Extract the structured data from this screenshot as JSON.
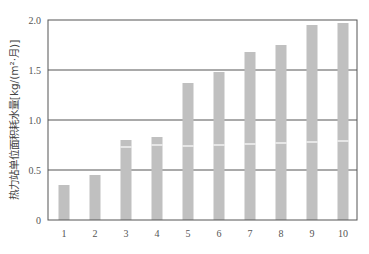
{
  "chart_data": {
    "type": "bar",
    "stacked": true,
    "title": "",
    "xlabel": "",
    "ylabel": "热力站单位面积耗水量[kg/(m²·月)]",
    "ylim": [
      0,
      2.0
    ],
    "yticks": [
      "0",
      "0.5",
      "1.0",
      "1.5",
      "2.0"
    ],
    "ytick_values": [
      0,
      0.5,
      1.0,
      1.5,
      2.0
    ],
    "grid": "horizontal",
    "legend": null,
    "categories": [
      "1",
      "2",
      "3",
      "4",
      "5",
      "6",
      "7",
      "8",
      "9",
      "10"
    ],
    "series": [
      {
        "name": "lower segment",
        "values": [
          0.35,
          0.45,
          0.73,
          0.75,
          0.74,
          0.75,
          0.76,
          0.77,
          0.78,
          0.79
        ]
      },
      {
        "name": "upper segment",
        "values": [
          0.0,
          0.0,
          0.07,
          0.08,
          0.63,
          0.73,
          0.92,
          0.98,
          1.17,
          1.18
        ]
      }
    ],
    "totals": [
      0.35,
      0.45,
      0.8,
      0.83,
      1.37,
      1.48,
      1.68,
      1.75,
      1.95,
      1.97
    ],
    "colors": {
      "bar": "#c0c0c0",
      "separator": "#ffffff",
      "axis": "#555555",
      "grid": "#555555"
    }
  }
}
